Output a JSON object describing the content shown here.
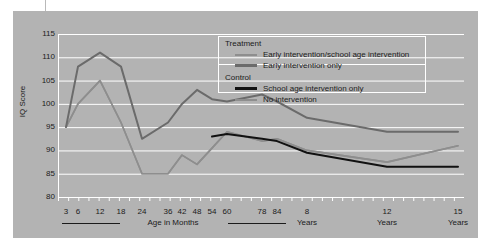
{
  "chart_data": {
    "type": "line",
    "title": "",
    "xlabel": "Age in Months",
    "ylabel": "IQ Score",
    "ylim": [
      80,
      115
    ],
    "yticks": [
      80,
      85,
      90,
      95,
      100,
      105,
      110,
      115
    ],
    "grid": true,
    "legend_position": "top-right",
    "x_axis_months_caption": "Age in Months",
    "x_tick_labels": [
      "3",
      "6",
      "12",
      "18",
      "24",
      "36",
      "42",
      "48",
      "54",
      "60",
      "78",
      "84",
      "8",
      "12",
      "15"
    ],
    "x_sub_labels": [
      "Years",
      "Years",
      "Years"
    ],
    "x_values": [
      3,
      6,
      12,
      18,
      24,
      36,
      42,
      48,
      54,
      60,
      78,
      84,
      96,
      144,
      180
    ],
    "series": [
      {
        "name": "Early intervention/school age intervention",
        "group": "Treatment",
        "color": "#8e8e8e",
        "width": 1.6,
        "values": [
          95,
          100,
          105,
          96,
          85,
          85,
          89,
          87,
          90.5,
          94,
          92,
          92.5,
          90,
          87.5,
          91
        ]
      },
      {
        "name": "Early intervention only",
        "group": "Treatment",
        "color": "#6b6b6b",
        "width": 2.0,
        "values": [
          95,
          108,
          111,
          108,
          92.5,
          96,
          100,
          103,
          101,
          100.5,
          102,
          100.5,
          97,
          94,
          94
        ]
      },
      {
        "name": "School age intervention only",
        "group": "Control",
        "color": "#111111",
        "width": 2.0,
        "values": [
          null,
          null,
          null,
          null,
          null,
          null,
          null,
          null,
          93,
          93.5,
          92.5,
          92,
          89.5,
          86.5,
          86.5
        ]
      },
      {
        "name": "No intervention",
        "group": "Control",
        "color": "#8e8e8e",
        "width": 1.6,
        "values": [
          95,
          100,
          105,
          96,
          85,
          85,
          89,
          87,
          90.5,
          94,
          92,
          92.5,
          90,
          87.5,
          91
        ]
      }
    ]
  },
  "legend": {
    "sections": [
      {
        "header": "Treatment",
        "entries": [
          {
            "label": "Early intervention/school age intervention",
            "color": "#8e8e8e",
            "thickness": "2px"
          },
          {
            "label": "Early intervention only",
            "color": "#6b6b6b",
            "thickness": "3px"
          }
        ]
      },
      {
        "header": "Control",
        "entries": [
          {
            "label": "School age intervention only",
            "color": "#111111",
            "thickness": "3px"
          },
          {
            "label": "No intervention",
            "color": "#8e8e8e",
            "thickness": "2px"
          }
        ]
      }
    ]
  },
  "axis": {
    "y_title": "IQ Score",
    "x_title": "Age in Months"
  },
  "colors": {
    "panel_background": "#b3b3b3",
    "gridline": "#ffffff",
    "text": "#1b1b1b"
  }
}
